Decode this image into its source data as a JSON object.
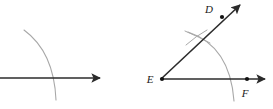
{
  "figure": {
    "background_color": "#ffffff",
    "width": 273,
    "height": 109
  },
  "colors": {
    "ray_stroke": "#2b2b2b",
    "arc_stroke": "#a8a8a8",
    "tick_stroke": "#a8a8a8",
    "point_fill": "#111111",
    "label_fill": "#1a1a1a"
  },
  "panels": [
    {
      "name": "left-panel",
      "description": "Partial construction: a horizontal ray crossed by a construction arc",
      "rays": [
        {
          "name": "horizontal-ray",
          "x1": 0,
          "y1": 78,
          "x2": 104,
          "y2": 78,
          "arrow": "end"
        }
      ],
      "arcs": [
        {
          "name": "construction-arc",
          "path": "M 24 30 Q 54 52 56 100"
        }
      ],
      "points": [],
      "labels": []
    },
    {
      "name": "right-panel",
      "description": "Completed angle DEF with vertex E, ray ED and ray EF, plus construction arc and tick marks",
      "rays": [
        {
          "name": "ray-ef",
          "x1": 161,
          "y1": 79,
          "x2": 269,
          "y2": 79,
          "arrow": "end"
        },
        {
          "name": "ray-ed",
          "x1": 161,
          "y1": 79,
          "x2": 243,
          "y2": 2,
          "arrow": "end"
        }
      ],
      "arcs": [
        {
          "name": "angle-arc",
          "path": "M 188 32 Q 230 46 234 101"
        },
        {
          "name": "tick-arc-upper",
          "path": "M 185 31 Q 199 37 209 42"
        },
        {
          "name": "tick-arc-lower",
          "path": "M 186 44 Q 196 36 206 31"
        }
      ],
      "points": [
        {
          "name": "point-e",
          "cx": 162,
          "cy": 79,
          "r": 2.1
        },
        {
          "name": "point-f",
          "cx": 247,
          "cy": 79,
          "r": 2.1
        },
        {
          "name": "point-d",
          "cx": 222,
          "cy": 17,
          "r": 2.1
        }
      ],
      "labels": [
        {
          "name": "label-e",
          "text": "E",
          "x": 150,
          "y": 83
        },
        {
          "name": "label-f",
          "text": "F",
          "x": 243,
          "y": 97
        },
        {
          "name": "label-d",
          "text": "D",
          "x": 207,
          "y": 12
        }
      ]
    }
  ]
}
